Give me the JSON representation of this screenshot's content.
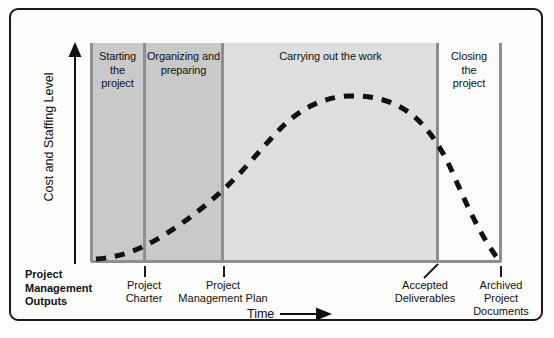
{
  "figure": {
    "title_visible": false,
    "axes": {
      "y_label": "Cost and Staffing Level",
      "y_arrow_icon": "up-arrow-icon",
      "x_label": "Time",
      "x_arrow_icon": "right-arrow-icon"
    },
    "phases": [
      {
        "id": "starting",
        "label": "Starting\nthe\nproject",
        "x_start_pct": 0.0,
        "x_end_pct": 12.96,
        "shade": "#c9c9c9"
      },
      {
        "id": "organizing",
        "label": "Organizing and\npreparing",
        "x_start_pct": 12.96,
        "x_end_pct": 32.27,
        "shade": "#c9c9c9"
      },
      {
        "id": "carrying",
        "label": "Carrying out the work",
        "x_start_pct": 32.27,
        "x_end_pct": 84.84,
        "shade": "#dedede"
      },
      {
        "id": "closing",
        "label": "Closing\nthe\nproject",
        "x_start_pct": 84.84,
        "x_end_pct": 100.0,
        "shade": "#fbfbfb"
      }
    ],
    "outputs": [
      {
        "id": "pmo",
        "label": "Project\nManagement\nOutputs",
        "bold": true,
        "marker": "none"
      },
      {
        "id": "charter",
        "label": "Project\nCharter",
        "bold": false,
        "marker": "tick"
      },
      {
        "id": "pmplan",
        "label": "Project\nManagement Plan",
        "bold": false,
        "marker": "tick"
      },
      {
        "id": "accepted",
        "label": "Accepted\nDeliverables",
        "bold": false,
        "marker": "leader"
      },
      {
        "id": "archived",
        "label": "Archived\nProject\nDocuments",
        "bold": false,
        "marker": "tick"
      }
    ]
  },
  "chart_data": {
    "type": "line",
    "xlabel": "Time",
    "ylabel": "Cost and Staffing Level",
    "series": [
      {
        "name": "Cost and staffing level",
        "style": "dashed",
        "color": "#111111",
        "x": [
          0,
          5,
          13,
          20,
          32,
          40,
          50,
          58,
          68,
          78,
          85,
          90,
          95,
          100
        ],
        "y": [
          1,
          4,
          11,
          20,
          40,
          58,
          72,
          79,
          80,
          74,
          60,
          40,
          20,
          2
        ]
      }
    ],
    "xlim": [
      0,
      100
    ],
    "ylim": [
      0,
      100
    ],
    "grid": false,
    "legend": false,
    "bands": [
      {
        "label": "Starting the project",
        "x_start": 0,
        "x_end": 12.96
      },
      {
        "label": "Organizing and preparing",
        "x_start": 12.96,
        "x_end": 32.27
      },
      {
        "label": "Carrying out the work",
        "x_start": 32.27,
        "x_end": 84.84
      },
      {
        "label": "Closing the project",
        "x_start": 84.84,
        "x_end": 100
      }
    ],
    "annotations": [
      {
        "text": "Project Charter",
        "x": 12.96
      },
      {
        "text": "Project Management Plan",
        "x": 32.27
      },
      {
        "text": "Accepted Deliverables",
        "x": 84.84
      },
      {
        "text": "Archived Project Documents",
        "x": 100
      }
    ]
  },
  "colors": {
    "band_dark": "#c9c9c9",
    "band_light": "#dedede",
    "band_white": "#fbfbfb",
    "separator": "#8e8e8e",
    "curve": "#111111",
    "frame": "#1a1a1a",
    "page": "#fdfdfc"
  }
}
